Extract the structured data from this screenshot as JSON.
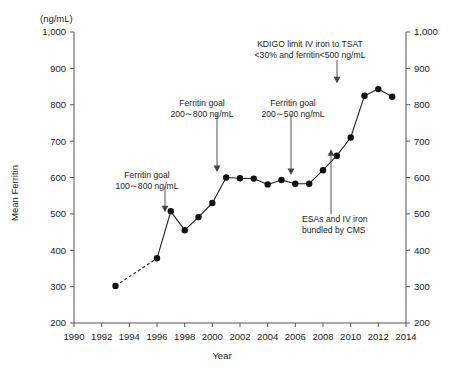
{
  "chart_data": {
    "type": "line",
    "title": "",
    "xlabel": "Year",
    "ylabel": "Mean Ferritin",
    "yunit": "(ng/mL)",
    "xlim": [
      1990,
      2014
    ],
    "ylim": [
      200,
      1000
    ],
    "xticks": [
      1990,
      1992,
      1994,
      1996,
      1998,
      2000,
      2002,
      2004,
      2006,
      2008,
      2010,
      2012,
      2014
    ],
    "yticks": [
      200,
      300,
      400,
      500,
      600,
      700,
      800,
      900,
      1000
    ],
    "ytick_labels": [
      "200",
      "300",
      "400",
      "500",
      "600",
      "700",
      "800",
      "900",
      "1,000"
    ],
    "xtick_labels": [
      "1990",
      "1992",
      "1994",
      "1996",
      "1998",
      "2000",
      "2002",
      "2004",
      "2006",
      "2008",
      "2010",
      "2012",
      "2014"
    ],
    "grid": false,
    "legend": "none",
    "right_axis_mirrors_left": true,
    "x": [
      1993,
      1996,
      1997,
      1998,
      1999,
      2000,
      2001,
      2002,
      2003,
      2004,
      2005,
      2006,
      2007,
      2008,
      2009,
      2010,
      2011,
      2012,
      2013
    ],
    "values": [
      302,
      378,
      507,
      455,
      491,
      530,
      600,
      598,
      597,
      581,
      593,
      583,
      583,
      620,
      660,
      710,
      825,
      843,
      822
    ],
    "dashed_segment": {
      "from_index": 0,
      "to_index": 1,
      "note": "dashed connector between 1993 and 1996"
    },
    "marker": "filled-circle",
    "annotations": [
      {
        "id": "ferritin-goal-100-800",
        "lines": [
          "Ferritin goal",
          "100∼800 ng/mL"
        ],
        "target_year": 1997.5,
        "target_value": 492
      },
      {
        "id": "ferritin-goal-200-800",
        "lines": [
          "Ferritin goal",
          "200∼800 ng/mL"
        ],
        "target_year": 2001,
        "target_value": 600
      },
      {
        "id": "ferritin-goal-200-500",
        "lines": [
          "Ferritin goal",
          "200∼500 ng/mL"
        ],
        "target_year": 2006,
        "target_value": 592
      },
      {
        "id": "kdigo-limit",
        "lines": [
          "KDIGO limit IV iron to TSAT",
          "<30% and ferritin<500 ng/mL"
        ],
        "target_year": 2012,
        "target_value": 852
      },
      {
        "id": "esa-bundling",
        "lines": [
          "ESAs and IV iron",
          "bundled by CMS"
        ],
        "target_year": 2010,
        "target_value": 690
      }
    ],
    "colors": {
      "line": "#222222",
      "marker": "#111111",
      "axis": "#555555",
      "text": "#222222",
      "background": "#ffffff"
    }
  }
}
